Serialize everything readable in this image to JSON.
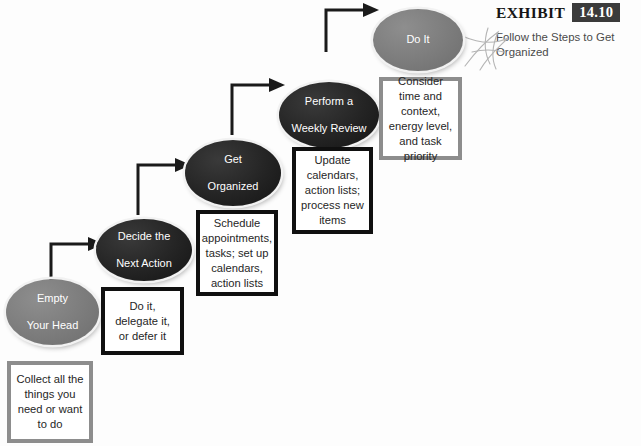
{
  "exhibit": {
    "label": "EXHIBIT",
    "number": "14.10",
    "subtitle": "Follow the Steps to Get Organized",
    "badge_color": "#3b3b3b",
    "squiggle_icon": "star-squiggle-icon"
  },
  "diagram": {
    "type": "flow-staircase",
    "node_dark_color": "#242424",
    "node_gray_color": "#7c7c7c",
    "box_border_black": "#101010",
    "box_border_gray": "#8d8d8d",
    "connector_color": "#1a1a1a",
    "steps": [
      {
        "id": "empty-your-head",
        "node_label": "Empty\nYour Head",
        "node_line1": "Empty",
        "node_line2": "Your Head",
        "node_style": "gray",
        "caption": "Collect all the things you need or want to do",
        "caption_border": "gray"
      },
      {
        "id": "decide-the-next-action",
        "node_label": "Decide the\nNext Action",
        "node_line1": "Decide the",
        "node_line2": "Next Action",
        "node_style": "dark",
        "caption": "Do it, delegate it, or defer it",
        "caption_border": "black"
      },
      {
        "id": "get-organized",
        "node_label": "Get\nOrganized",
        "node_line1": "Get",
        "node_line2": "Organized",
        "node_style": "dark",
        "caption": "Schedule appointments, tasks; set up calendars, action lists",
        "caption_border": "black"
      },
      {
        "id": "perform-a-weekly-review",
        "node_label": "Perform a\nWeekly Review",
        "node_line1": "Perform a",
        "node_line2": "Weekly Review",
        "node_style": "dark",
        "caption": "Update calendars, action lists; process new items",
        "caption_border": "black"
      },
      {
        "id": "do-it",
        "node_label": "Do It",
        "node_line1": "Do It",
        "node_line2": "",
        "node_style": "gray",
        "caption": "Consider time and context, energy level, and task priority",
        "caption_border": "gray"
      }
    ]
  }
}
